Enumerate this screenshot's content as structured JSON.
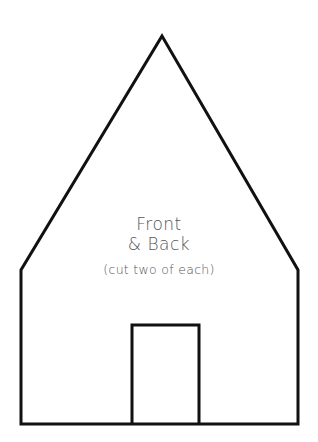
{
  "template": {
    "title_line1": "Front",
    "title_line2": "& Back",
    "instruction": "(cut two of each)"
  },
  "colors": {
    "outline": "#111111",
    "text": "#555555",
    "background": "#ffffff"
  }
}
